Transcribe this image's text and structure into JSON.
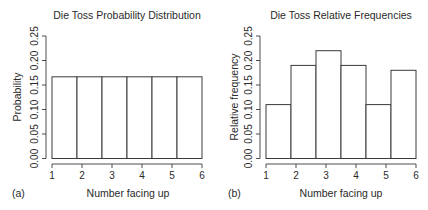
{
  "chart_data": [
    {
      "panel_label": "(a)",
      "type": "bar",
      "title": "Die Toss Probability Distribution",
      "xlabel": "Number facing up",
      "ylabel": "Probability",
      "categories": [
        "1",
        "2",
        "3",
        "4",
        "5",
        "6"
      ],
      "values": [
        0.1667,
        0.1667,
        0.1667,
        0.1667,
        0.1667,
        0.1667
      ],
      "xticks": [
        "1",
        "2",
        "3",
        "4",
        "5",
        "6"
      ],
      "yticks": [
        "0.00",
        "0.05",
        "0.10",
        "0.15",
        "0.20",
        "0.25"
      ],
      "ylim": [
        0,
        0.25
      ],
      "xlim": [
        1,
        6
      ],
      "grid": false,
      "legend": null
    },
    {
      "panel_label": "(b)",
      "type": "bar",
      "title": "Die Toss Relative Frequencies",
      "xlabel": "Number facing up",
      "ylabel": "Relative frequency",
      "categories": [
        "1",
        "2",
        "3",
        "4",
        "5",
        "6"
      ],
      "values": [
        0.11,
        0.19,
        0.22,
        0.19,
        0.11,
        0.18
      ],
      "xticks": [
        "1",
        "2",
        "3",
        "4",
        "5",
        "6"
      ],
      "yticks": [
        "0.00",
        "0.05",
        "0.10",
        "0.15",
        "0.20",
        "0.25"
      ],
      "ylim": [
        0,
        0.25
      ],
      "xlim": [
        1,
        6
      ],
      "grid": false,
      "legend": null
    }
  ],
  "colors": {
    "bar_fill": "#ffffff",
    "bar_stroke": "#3a3a3a",
    "text": "#2a2a2a",
    "background": "#ffffff"
  }
}
